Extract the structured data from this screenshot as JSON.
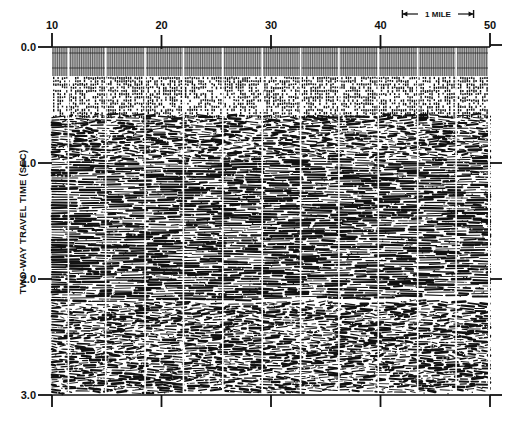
{
  "chart_data": {
    "type": "heatmap",
    "title": "",
    "xlabel": "",
    "ylabel": "TWO-WAY TRAVEL TIME (SEC)",
    "x_ticks": [
      10,
      20,
      30,
      40,
      50
    ],
    "x_tick_labels": [
      "10",
      "20",
      "30",
      "40",
      "50"
    ],
    "xlim": [
      10,
      50
    ],
    "y_ticks": [
      0.0,
      1.0,
      2.0,
      3.0
    ],
    "y_tick_labels": [
      "0.0",
      "1.0",
      "2.0",
      "3.0"
    ],
    "ylim": [
      0.0,
      3.0
    ],
    "y_inverted": true,
    "scale_bar": {
      "label": "1 MILE",
      "from_x": 42,
      "to_x": 48.5
    },
    "trace_panel_separators_x": [
      11.5,
      14.9,
      18.5,
      22.0,
      25.6,
      29.2,
      32.7,
      36.2,
      39.8,
      43.4,
      46.9
    ],
    "zones": [
      {
        "name": "water-column-dense-traces",
        "from_s": 0.0,
        "to_s": 0.25
      },
      {
        "name": "dotted-multiples",
        "from_s": 0.25,
        "to_s": 0.6
      },
      {
        "name": "seafloor-reflectors",
        "from_s": 0.6,
        "to_s": 1.0
      },
      {
        "name": "coherent-layered-reflectors",
        "from_s": 1.0,
        "to_s": 2.2
      },
      {
        "name": "chaotic-reflectors",
        "from_s": 2.2,
        "to_s": 3.0
      }
    ],
    "grid": false,
    "legend": "none"
  },
  "colors": {
    "ink": "#111111",
    "paper": "#ffffff",
    "trace_gray": "#9a9a9a"
  }
}
